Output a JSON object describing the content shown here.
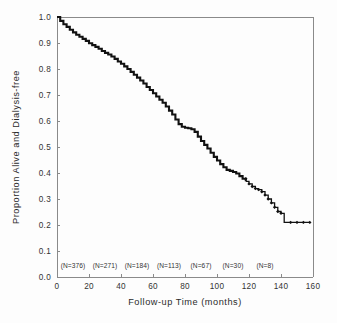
{
  "figure": {
    "background_color": "#fdfdfd",
    "axis_color": "#8a8a8a",
    "curve_color": "#111111"
  },
  "chart_data": {
    "type": "line",
    "title": "",
    "subtitle": "",
    "xlabel": "Follow-up Time (months)",
    "ylabel": "Proportion Alive and Dialysis-free",
    "xlim": [
      0,
      160
    ],
    "ylim": [
      0.0,
      1.0
    ],
    "grid": false,
    "legend": "none",
    "xticks": [
      0,
      20,
      40,
      60,
      80,
      100,
      120,
      140,
      160
    ],
    "xtick_labels": [
      "0",
      "20",
      "40",
      "60",
      "80",
      "100",
      "120",
      "140",
      "160"
    ],
    "yticks": [
      0.0,
      0.1,
      0.2,
      0.3,
      0.4,
      0.5,
      0.6,
      0.7,
      0.8,
      0.9,
      1.0
    ],
    "ytick_labels": [
      "0.0",
      "0.1",
      "0.2",
      "0.3",
      "0.4",
      "0.5",
      "0.6",
      "0.7",
      "0.8",
      "0.9",
      "1.0"
    ],
    "series": [
      {
        "name": "Kaplan-Meier survival (alive and dialysis-free)",
        "style": "step",
        "x": [
          0,
          2,
          4,
          6,
          8,
          10,
          12,
          14,
          16,
          18,
          20,
          22,
          24,
          26,
          28,
          30,
          32,
          34,
          36,
          38,
          40,
          42,
          44,
          46,
          48,
          50,
          52,
          54,
          56,
          58,
          60,
          62,
          64,
          66,
          68,
          70,
          72,
          74,
          76,
          78,
          80,
          82,
          84,
          86,
          88,
          90,
          92,
          94,
          96,
          98,
          100,
          102,
          104,
          106,
          108,
          110,
          112,
          114,
          116,
          118,
          120,
          122,
          124,
          126,
          128,
          130,
          132,
          134,
          136,
          138,
          140,
          142,
          144,
          146,
          148,
          150,
          152,
          154,
          156,
          158
        ],
        "y": [
          1.0,
          0.985,
          0.972,
          0.962,
          0.951,
          0.941,
          0.932,
          0.924,
          0.916,
          0.908,
          0.899,
          0.892,
          0.885,
          0.878,
          0.869,
          0.862,
          0.856,
          0.848,
          0.839,
          0.829,
          0.82,
          0.81,
          0.8,
          0.789,
          0.778,
          0.767,
          0.756,
          0.744,
          0.731,
          0.719,
          0.707,
          0.694,
          0.682,
          0.67,
          0.656,
          0.64,
          0.625,
          0.606,
          0.588,
          0.578,
          0.574,
          0.572,
          0.568,
          0.558,
          0.54,
          0.523,
          0.508,
          0.494,
          0.478,
          0.462,
          0.448,
          0.434,
          0.422,
          0.412,
          0.408,
          0.404,
          0.398,
          0.388,
          0.378,
          0.368,
          0.358,
          0.348,
          0.34,
          0.336,
          0.328,
          0.315,
          0.3,
          0.285,
          0.268,
          0.252,
          0.245,
          0.21,
          0.21,
          0.21,
          0.21,
          0.21,
          0.21,
          0.21,
          0.21,
          0.21
        ]
      }
    ],
    "censor_marks_x": [
      118,
      120,
      122,
      124,
      126,
      128,
      130,
      132,
      134,
      136,
      138,
      140,
      146,
      150,
      154,
      158
    ],
    "censor_marks_y": [
      0.378,
      0.358,
      0.348,
      0.34,
      0.336,
      0.328,
      0.315,
      0.3,
      0.285,
      0.268,
      0.252,
      0.245,
      0.21,
      0.21,
      0.21,
      0.21
    ],
    "annotations": [
      {
        "label": "(N=376)",
        "x": 10
      },
      {
        "label": "(N=271)",
        "x": 30
      },
      {
        "label": "(N=184)",
        "x": 50
      },
      {
        "label": "(N=113)",
        "x": 70
      },
      {
        "label": "(N=67)",
        "x": 90
      },
      {
        "label": "(N=30)",
        "x": 110
      },
      {
        "label": "(N=8)",
        "x": 130
      }
    ],
    "annotation_y": 0.035
  }
}
